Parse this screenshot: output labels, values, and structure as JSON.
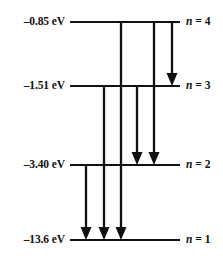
{
  "diagram": {
    "type": "energy-level-diagram",
    "color": "#111111",
    "background": "#ffffff",
    "levels": [
      {
        "id": "n4",
        "quantum_number": 4,
        "energy_label": "–0.85 eV",
        "energy_value": -0.85,
        "energy_unit": "eV",
        "level_label": "n = 4",
        "n_symbol": "n",
        "n_equals": " = 4",
        "y": 22,
        "x_start": 70,
        "x_end": 180
      },
      {
        "id": "n3",
        "quantum_number": 3,
        "energy_label": "–1.51 eV",
        "energy_value": -1.51,
        "energy_unit": "eV",
        "level_label": "n = 3",
        "n_symbol": "n",
        "n_equals": " = 3",
        "y": 86,
        "x_start": 70,
        "x_end": 180
      },
      {
        "id": "n2",
        "quantum_number": 2,
        "energy_label": "–3.40 eV",
        "energy_value": -3.4,
        "energy_unit": "eV",
        "level_label": "n = 2",
        "n_symbol": "n",
        "n_equals": " = 2",
        "y": 165,
        "x_start": 70,
        "x_end": 180
      },
      {
        "id": "n1",
        "quantum_number": 1,
        "energy_label": "–13.6 eV",
        "energy_value": -13.6,
        "energy_unit": "eV",
        "level_label": "n = 1",
        "n_symbol": "n",
        "n_equals": " = 1",
        "y": 240,
        "x_start": 70,
        "x_end": 180
      }
    ],
    "transitions": [
      {
        "id": "t-2-1",
        "from": 2,
        "to": 1,
        "x": 86,
        "y_start": 165,
        "y_end": 240
      },
      {
        "id": "t-3-1",
        "from": 3,
        "to": 1,
        "x": 104,
        "y_start": 86,
        "y_end": 240
      },
      {
        "id": "t-4-1",
        "from": 4,
        "to": 1,
        "x": 121,
        "y_start": 22,
        "y_end": 240
      },
      {
        "id": "t-3-2",
        "from": 3,
        "to": 2,
        "x": 137,
        "y_start": 86,
        "y_end": 165
      },
      {
        "id": "t-4-2",
        "from": 4,
        "to": 2,
        "x": 154,
        "y_start": 22,
        "y_end": 165
      },
      {
        "id": "t-4-3",
        "from": 4,
        "to": 3,
        "x": 172,
        "y_start": 22,
        "y_end": 86
      }
    ]
  },
  "chart_data": {
    "type": "line",
    "title": "",
    "xlabel": "",
    "ylabel": "Energy (eV)",
    "categories": [
      "n = 1",
      "n = 2",
      "n = 3",
      "n = 4"
    ],
    "values": [
      -13.6,
      -3.4,
      -1.51,
      -0.85
    ],
    "tick_labels": [
      "–13.6 eV",
      "–3.40 eV",
      "–1.51 eV",
      "–0.85 eV"
    ],
    "annotations": [
      "n = 2 → n = 1",
      "n = 3 → n = 1",
      "n = 4 → n = 1",
      "n = 3 → n = 2",
      "n = 4 → n = 2",
      "n = 4 → n = 3"
    ],
    "grid": false,
    "legend": "none"
  }
}
